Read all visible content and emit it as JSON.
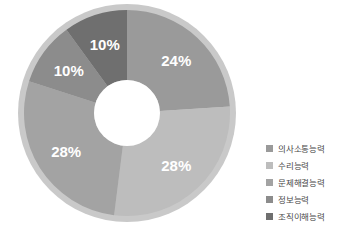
{
  "chart_data": {
    "type": "pie",
    "variant": "donut",
    "title": "",
    "subtitle": "",
    "xlabel": "",
    "ylabel": "",
    "legend_position": "right",
    "grid": false,
    "start_angle_deg": 0,
    "direction": "clockwise",
    "categories": [
      "의사소통능력",
      "수리능력",
      "문제해결능력",
      "정보능력",
      "조직이해능력"
    ],
    "values": [
      24,
      28,
      28,
      10,
      10
    ],
    "value_unit": "%",
    "data_labels": [
      "24%",
      "28%",
      "28%",
      "10%",
      "10%"
    ],
    "colors": [
      "#9a9a9a",
      "#bdbdbd",
      "#a3a3a3",
      "#8c8c8c",
      "#6f6f6f"
    ],
    "rim_color": "#c9c9c9",
    "hole_color": "#ffffff",
    "label_color": "#ffffff",
    "slices": [
      {
        "label": "의사소통능력",
        "value": 24,
        "display": "24%",
        "color": "#9a9a9a"
      },
      {
        "label": "수리능력",
        "value": 28,
        "display": "28%",
        "color": "#bdbdbd"
      },
      {
        "label": "문제해결능력",
        "value": 28,
        "display": "28%",
        "color": "#a3a3a3"
      },
      {
        "label": "정보능력",
        "value": 10,
        "display": "10%",
        "color": "#8c8c8c"
      },
      {
        "label": "조직이해능력",
        "value": 10,
        "display": "10%",
        "color": "#6f6f6f"
      }
    ]
  },
  "legend": {
    "items": [
      {
        "label": "의사소통능력",
        "color": "#9a9a9a"
      },
      {
        "label": "수리능력",
        "color": "#bdbdbd"
      },
      {
        "label": "문제해결능력",
        "color": "#a3a3a3"
      },
      {
        "label": "정보능력",
        "color": "#8c8c8c"
      },
      {
        "label": "조직이해능력",
        "color": "#6f6f6f"
      }
    ]
  },
  "geometry": {
    "cx": 127,
    "cy": 113,
    "outer_radius": 109,
    "rim_radius": 103,
    "inner_radius": 33,
    "label_radius": 72
  }
}
